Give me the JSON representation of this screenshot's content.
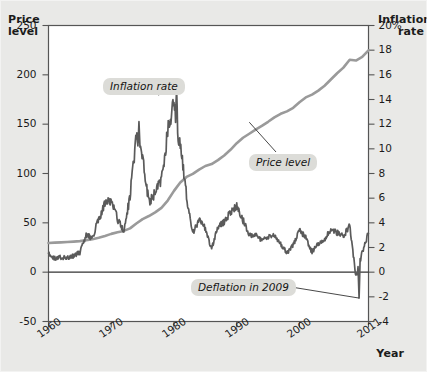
{
  "figure": {
    "left_axis_title": "Price\nlevel",
    "left_axis_title_line1": "Price",
    "left_axis_title_line2": "level",
    "right_axis_title_line1": "Inflation",
    "right_axis_title_line2": "rate",
    "x_axis_title": "Year",
    "background_color": "#e9e9e7",
    "plot_background_color": "#ffffff",
    "price_line_color": "#9a9a9a",
    "inflation_line_color": "#5a5a5a",
    "callout_background": "#dcdcd8"
  },
  "callouts": [
    {
      "id": "inflation-rate",
      "label": "Inflation rate"
    },
    {
      "id": "price-level",
      "label": "Price level"
    },
    {
      "id": "deflation-2009",
      "label": "Deflation in 2009"
    }
  ],
  "chart_data": {
    "type": "line",
    "title": "",
    "subtitle": "",
    "xlabel": "Year",
    "grid": false,
    "legend": "annotations-inline",
    "x": [
      1960,
      1961,
      1962,
      1963,
      1964,
      1965,
      1966,
      1967,
      1968,
      1969,
      1970,
      1971,
      1972,
      1973,
      1974,
      1975,
      1976,
      1977,
      1978,
      1979,
      1980,
      1981,
      1982,
      1983,
      1984,
      1985,
      1986,
      1987,
      1988,
      1989,
      1990,
      1991,
      1992,
      1993,
      1994,
      1995,
      1996,
      1997,
      1998,
      1999,
      2000,
      2001,
      2002,
      2003,
      2004,
      2005,
      2006,
      2007,
      2008,
      2009,
      2010,
      2011
    ],
    "xlim": [
      1960,
      2011
    ],
    "xticks": [
      1960,
      1970,
      1980,
      1990,
      2000,
      2011
    ],
    "xticklabels": [
      "1960",
      "1970",
      "1980",
      "1990",
      "2000",
      "2011"
    ],
    "axes": [
      {
        "id": "left",
        "name": "Price level",
        "label_line1": "Price",
        "label_line2": "level",
        "ylim": [
          -50,
          250
        ],
        "yticks": [
          -50,
          0,
          50,
          100,
          150,
          200,
          250
        ],
        "yticklabels": [
          "-50",
          "0",
          "50",
          "100",
          "150",
          "200",
          "250"
        ],
        "position": "left"
      },
      {
        "id": "right",
        "name": "Inflation rate",
        "label_line1": "Inflation",
        "label_line2": "rate",
        "ylim": [
          -4,
          20
        ],
        "yticks": [
          -4,
          -2,
          0,
          2,
          4,
          6,
          8,
          10,
          12,
          14,
          16,
          18,
          20
        ],
        "yticklabels": [
          "-4",
          "-2",
          "0",
          "2",
          "4",
          "6",
          "8",
          "10",
          "12",
          "14",
          "16",
          "18",
          "20%"
        ],
        "unit": "%",
        "position": "right"
      }
    ],
    "series": [
      {
        "name": "Price level",
        "axis": "left",
        "color": "#9a9a9a",
        "values": [
          29.6,
          29.9,
          30.2,
          30.6,
          31.0,
          31.5,
          32.4,
          33.4,
          34.8,
          36.7,
          38.8,
          40.5,
          41.8,
          44.4,
          49.3,
          53.8,
          56.9,
          60.6,
          65.2,
          72.6,
          82.4,
          90.9,
          96.5,
          99.6,
          103.9,
          107.6,
          109.6,
          113.6,
          118.3,
          124.0,
          130.7,
          136.2,
          140.3,
          144.5,
          148.2,
          152.4,
          156.9,
          160.5,
          163.0,
          166.6,
          172.2,
          177.1,
          179.9,
          184.0,
          188.9,
          195.3,
          201.6,
          207.3,
          215.3,
          214.5,
          218.1,
          224.9
        ]
      },
      {
        "name": "Inflation rate",
        "axis": "right",
        "color": "#5a5a5a",
        "note": "monthly values; annual averages listed",
        "values": [
          1.5,
          1.1,
          1.2,
          1.2,
          1.3,
          1.6,
          3.0,
          2.8,
          4.3,
          5.5,
          5.8,
          4.3,
          3.3,
          6.2,
          11.1,
          9.1,
          5.7,
          6.5,
          7.6,
          11.3,
          13.5,
          10.3,
          6.2,
          3.2,
          4.3,
          3.5,
          1.9,
          3.7,
          4.1,
          4.8,
          5.4,
          4.2,
          3.0,
          3.0,
          2.6,
          2.8,
          3.0,
          2.3,
          1.6,
          2.2,
          3.4,
          2.8,
          1.6,
          2.3,
          2.7,
          3.4,
          3.2,
          2.9,
          3.8,
          -0.4,
          1.6,
          3.2
        ],
        "peaks": [
          {
            "year": 1974,
            "value": 12.2
          },
          {
            "year": 1980,
            "value": 14.8
          }
        ],
        "troughs": [
          {
            "year": 2009,
            "value": -2.1
          }
        ]
      }
    ],
    "annotations": [
      {
        "text": "Inflation rate",
        "points_to_series": "Inflation rate",
        "points_to_x": 1980,
        "points_to_y": 14.8
      },
      {
        "text": "Price level",
        "points_to_series": "Price level",
        "points_to_x": 1995,
        "points_to_y": 152
      },
      {
        "text": "Deflation in 2009",
        "points_to_series": "Inflation rate",
        "points_to_x": 2009,
        "points_to_y": -2.1
      }
    ]
  }
}
